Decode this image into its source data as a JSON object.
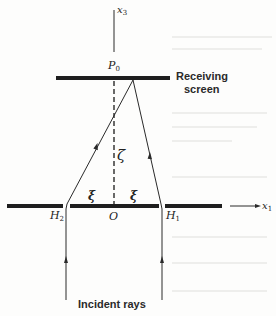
{
  "diagram": {
    "axes": {
      "x1_label": "x",
      "x1_sub": "1",
      "x3_label": "x",
      "x3_sub": "3"
    },
    "points": {
      "p0_label": "P",
      "p0_sub": "0",
      "origin_label": "O",
      "h1_label": "H",
      "h1_sub": "1",
      "h2_label": "H",
      "h2_sub": "2"
    },
    "distances": {
      "xi_left": "ξ",
      "xi_right": "ξ",
      "zeta": "ζ"
    },
    "labels": {
      "receiving_screen_line1": "Receiving",
      "receiving_screen_line2": "screen",
      "incident_rays": "Incident rays"
    },
    "colors": {
      "ink": "#2a2a2a",
      "paper": "#fdfdfc"
    }
  }
}
